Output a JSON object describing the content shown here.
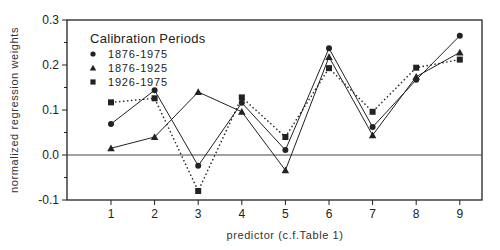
{
  "chart_data": {
    "type": "line",
    "title": "",
    "xlabel": "predictor (c.f.Table 1)",
    "ylabel": "normalized regression weights",
    "x": [
      1,
      2,
      3,
      4,
      5,
      6,
      7,
      8,
      9
    ],
    "x_tick_labels": [
      "1",
      "2",
      "3",
      "4",
      "5",
      "6",
      "7",
      "8",
      "9"
    ],
    "y_tick_labels": [
      "-0.1",
      "0.0",
      "0.1",
      "0.2",
      "0.3"
    ],
    "y_ticks": [
      -0.1,
      0.0,
      0.1,
      0.2,
      0.3
    ],
    "ylim": [
      -0.1,
      0.3
    ],
    "xlim": [
      0,
      9.5
    ],
    "grid": false,
    "zero_line": true,
    "legend": {
      "title": "Calibration Periods",
      "position": "upper-left"
    },
    "series": [
      {
        "name": "1876-1975",
        "marker": "circle",
        "line_style": "solid",
        "values": [
          0.069,
          0.144,
          -0.024,
          0.116,
          0.011,
          0.237,
          0.062,
          0.167,
          0.265
        ]
      },
      {
        "name": "1876-1925",
        "marker": "triangle",
        "line_style": "solid",
        "values": [
          0.015,
          0.04,
          0.14,
          0.096,
          -0.034,
          0.218,
          0.044,
          0.174,
          0.228
        ]
      },
      {
        "name": "1926-1975",
        "marker": "square",
        "line_style": "dotted",
        "values": [
          0.117,
          0.126,
          -0.08,
          0.128,
          0.04,
          0.193,
          0.096,
          0.194,
          0.212
        ]
      }
    ]
  },
  "colors": {
    "line": "#222222",
    "frame": "#222222",
    "background": "#ffffff"
  }
}
